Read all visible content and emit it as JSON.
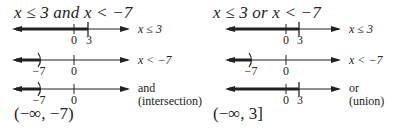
{
  "left": {
    "title": "x ≤ 3 and x < −7",
    "lines": [
      {
        "label": "x ≤ 3",
        "ticks": [
          "0",
          "3"
        ]
      },
      {
        "label": "x < −7",
        "ticks": [
          "−7",
          "0"
        ]
      },
      {
        "label_line1": "and",
        "label_line2": "(intersection)",
        "ticks": [
          "−7",
          "0"
        ]
      }
    ],
    "result": "(−∞, −7)"
  },
  "right": {
    "title": "x ≤ 3 or x < −7",
    "lines": [
      {
        "label": "x ≤ 3",
        "ticks": [
          "0",
          "3"
        ]
      },
      {
        "label": "x < −7",
        "ticks": [
          "−7",
          "0"
        ]
      },
      {
        "label_line1": "or",
        "label_line2": "(union)",
        "ticks": [
          "0",
          "3"
        ]
      }
    ],
    "result": "(−∞, 3]"
  },
  "colors": {
    "ink": "#222222",
    "shade": "#333333"
  }
}
